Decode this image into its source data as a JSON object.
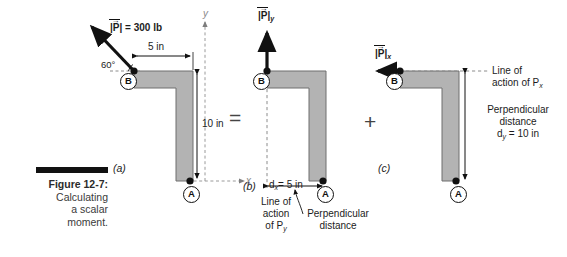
{
  "figure": {
    "number": "Figure 12-7:",
    "caption_line1": "Calculating",
    "caption_line2": "a scalar",
    "caption_line3": "moment."
  },
  "operators": {
    "equals": "=",
    "plus": "+"
  },
  "panels": [
    {
      "id": "(a)",
      "axis_x_label": "x",
      "axis_y_label": "y",
      "point_b": "B",
      "point_a": "A",
      "force_label": "P",
      "force_magnitude": "| | = 300 lb",
      "force_value": "300 lb",
      "angle": "60",
      "angle_unit": "°",
      "dim_horizontal": "5 in",
      "dim_vertical": "10 in"
    },
    {
      "id": "(b)",
      "point_b": "B",
      "point_a": "A",
      "force_label": "P",
      "force_subscript": "y",
      "distance_label": "d",
      "distance_subscript": "x",
      "distance_value": "= 5 in",
      "line_of_action_l1": "Line of",
      "line_of_action_l2": "action",
      "line_of_action_l3": "of P",
      "line_of_action_sub": "y",
      "perp_l1": "Perpendicular",
      "perp_l2": "distance"
    },
    {
      "id": "(c)",
      "point_b": "B",
      "point_a": "A",
      "force_label": "P",
      "force_subscript": "x",
      "line_of_action_l1": "Line of",
      "line_of_action_l2": "action of P",
      "line_of_action_sub": "x",
      "perp_l1": "Perpendicular",
      "perp_l2": "distance",
      "perp_l3": "d",
      "perp_sub": "y",
      "perp_l4": "= 10 in"
    }
  ],
  "colors": {
    "body_fill": "#b3b3b3",
    "body_stroke": "#6e6e6e",
    "ink": "#111111",
    "dashed": "#8c8c8c"
  }
}
